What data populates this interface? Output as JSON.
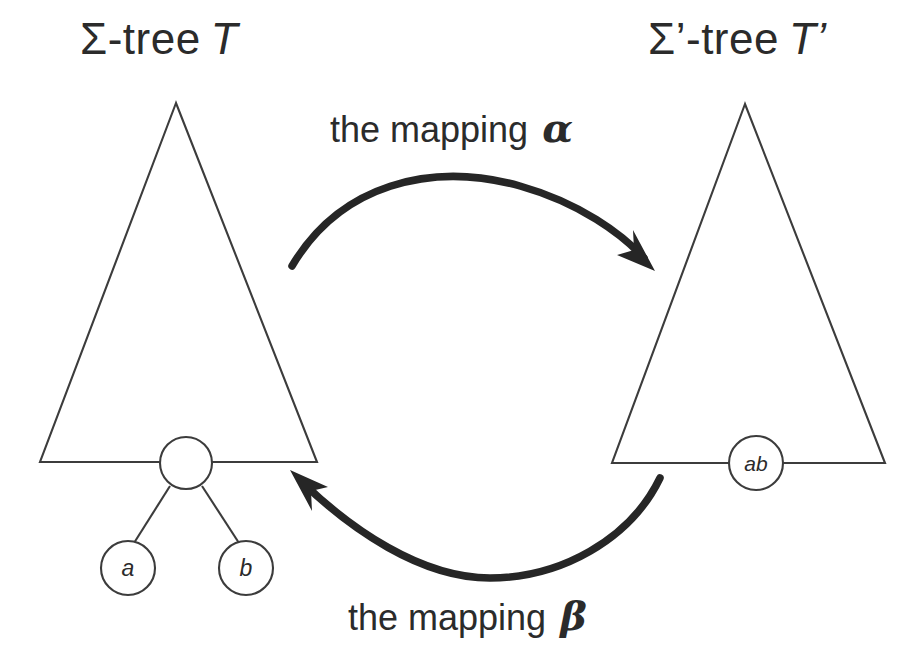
{
  "canvas": {
    "width": 914,
    "height": 661,
    "background": "#ffffff",
    "ink": "#3c3c3c",
    "arrow_color": "#262626",
    "text_color": "#2b2b2b"
  },
  "labels": {
    "left_tree": {
      "prefix": "Σ-tree",
      "symbol": "T"
    },
    "right_tree": {
      "prefix": "Σ’-tree",
      "symbol": "T’"
    },
    "mapping_alpha": {
      "text": "the mapping",
      "symbol": "α"
    },
    "mapping_beta": {
      "text": "the mapping",
      "symbol": "β"
    }
  },
  "left_tree": {
    "name": "Sigma-tree T",
    "root_node_label": "",
    "children": [
      {
        "label": "a"
      },
      {
        "label": "b"
      }
    ]
  },
  "right_tree": {
    "name": "Sigma'-tree T'",
    "node_label": "ab"
  },
  "arrows": [
    {
      "id": "alpha",
      "from": "left-tree",
      "to": "right-tree",
      "direction": "left-to-right",
      "label": "the mapping α"
    },
    {
      "id": "beta",
      "from": "right-tree",
      "to": "left-tree",
      "direction": "right-to-left",
      "label": "the mapping β"
    }
  ]
}
